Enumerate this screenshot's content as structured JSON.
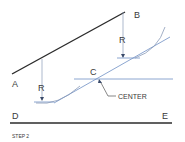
{
  "diagram": {
    "step_label": "STEP 2",
    "points": {
      "A": "A",
      "B": "B",
      "C": "C",
      "D": "D",
      "E": "E"
    },
    "radius_label_left": "R",
    "radius_label_right": "R",
    "center_label": "CENTER",
    "colors": {
      "main_line": "#2b2b2b",
      "construction_line": "#6f8fc4",
      "text": "#3a3a3a"
    }
  }
}
